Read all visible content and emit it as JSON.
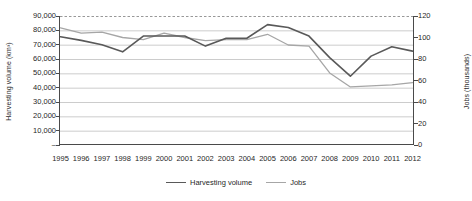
{
  "chart_data": {
    "type": "line",
    "title": "",
    "x": [
      1995,
      1996,
      1997,
      1998,
      1999,
      2000,
      2001,
      2002,
      2003,
      2004,
      2005,
      2006,
      2007,
      2008,
      2009,
      2010,
      2011,
      2012
    ],
    "categories": [
      "1995",
      "1996",
      "1997",
      "1998",
      "1999",
      "2000",
      "2001",
      "2002",
      "2003",
      "2004",
      "2005",
      "2006",
      "2007",
      "2008",
      "2009",
      "2010",
      "2011",
      "2012"
    ],
    "series": [
      {
        "name": "Harvesting volume",
        "axis": "left",
        "color": "#595959",
        "values": [
          75500,
          73000,
          70000,
          65000,
          76000,
          76000,
          76000,
          69000,
          74500,
          74500,
          84000,
          82000,
          76000,
          61000,
          48000,
          62000,
          68500,
          65500
        ]
      },
      {
        "name": "Jobs",
        "axis": "right",
        "color": "#a6a6a6",
        "values": [
          109,
          104,
          105,
          100,
          98,
          104,
          100,
          97,
          98,
          98,
          103,
          93,
          92,
          67,
          54,
          55,
          56,
          58
        ]
      }
    ],
    "xlabel": "",
    "ylabel": "Harvesting volume (km³)",
    "y2label": "Jobs (thousands)",
    "ylim": [
      0,
      90000
    ],
    "y2lim": [
      0,
      120
    ],
    "yticks": [
      "–",
      "10,000",
      "20,000",
      "30,000",
      "40,000",
      "50,000",
      "60,000",
      "70,000",
      "80,000",
      "90,000"
    ],
    "ytick_values": [
      0,
      10000,
      20000,
      30000,
      40000,
      50000,
      60000,
      70000,
      80000,
      90000
    ],
    "y2ticks": [
      "0",
      "20",
      "40",
      "60",
      "80",
      "100",
      "120"
    ],
    "y2tick_values": [
      0,
      20,
      40,
      60,
      80,
      100,
      120
    ],
    "grid": true,
    "legend_position": "bottom",
    "legend": [
      "Harvesting volume",
      "Jobs"
    ]
  },
  "axes": {
    "left_title": "Harvesting volume (km³)",
    "right_title": "Jobs (thousands)"
  },
  "legend": {
    "items": [
      {
        "label": "Harvesting volume",
        "color": "#595959"
      },
      {
        "label": "Jobs",
        "color": "#a6a6a6"
      }
    ]
  },
  "colors": {
    "harvesting_volume": "#595959",
    "jobs": "#a6a6a6",
    "grid": "#bfbfbf",
    "axis": "#4a4a4a",
    "top_border": "#8c8c8c"
  }
}
